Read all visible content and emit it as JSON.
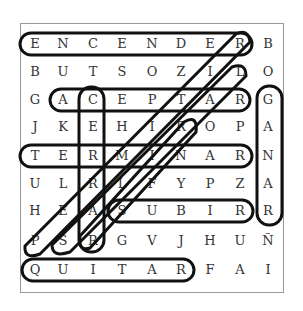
{
  "puzzle": {
    "type": "word-search",
    "rows": 9,
    "cols": 9,
    "grid": [
      [
        "E",
        "N",
        "C",
        "E",
        "N",
        "D",
        "E",
        "R",
        "B"
      ],
      [
        "B",
        "U",
        "T",
        "S",
        "O",
        "Z",
        "I",
        "L",
        "O"
      ],
      [
        "G",
        "A",
        "C",
        "E",
        "P",
        "T",
        "A",
        "R",
        "G"
      ],
      [
        "J",
        "K",
        "E",
        "H",
        "I",
        "R",
        "O",
        "P",
        "A"
      ],
      [
        "T",
        "E",
        "R",
        "M",
        "I",
        "N",
        "A",
        "R",
        "N"
      ],
      [
        "U",
        "L",
        "R",
        "L",
        "F",
        "Y",
        "P",
        "Z",
        "A"
      ],
      [
        "H",
        "E",
        "A",
        "S",
        "U",
        "B",
        "I",
        "R",
        "R"
      ],
      [
        "P",
        "S",
        "R",
        "G",
        "V",
        "J",
        "H",
        "U",
        "Ñ"
      ],
      [
        "Q",
        "U",
        "I",
        "T",
        "A",
        "R",
        "F",
        "A",
        "I"
      ]
    ],
    "found_words": [
      {
        "word": "ENCENDER",
        "direction": "horizontal",
        "start": [
          0,
          0
        ],
        "end": [
          0,
          7
        ]
      },
      {
        "word": "ACEPTAR",
        "direction": "horizontal",
        "start": [
          2,
          1
        ],
        "end": [
          2,
          7
        ]
      },
      {
        "word": "TERMINAR",
        "direction": "horizontal",
        "start": [
          4,
          0
        ],
        "end": [
          4,
          7
        ]
      },
      {
        "word": "SUBIR",
        "direction": "horizontal",
        "start": [
          6,
          3
        ],
        "end": [
          6,
          7
        ]
      },
      {
        "word": "QUITAR",
        "direction": "horizontal",
        "start": [
          8,
          0
        ],
        "end": [
          8,
          5
        ]
      },
      {
        "word": "CERRAR",
        "direction": "vertical",
        "start": [
          2,
          2
        ],
        "end": [
          7,
          2
        ]
      },
      {
        "word": "GANAR",
        "direction": "vertical",
        "start": [
          2,
          8
        ],
        "end": [
          6,
          8
        ]
      },
      {
        "word": "PERDER",
        "direction": "diagonal",
        "start": [
          7,
          0
        ],
        "end": [
          0,
          7
        ]
      },
      {
        "word": "SALIR",
        "direction": "diagonal",
        "start": [
          7,
          1
        ],
        "end": [
          1,
          7
        ]
      },
      {
        "word": "RAIR",
        "direction": "diagonal",
        "start": [
          7,
          2
        ],
        "end": [
          3,
          5
        ]
      }
    ]
  }
}
